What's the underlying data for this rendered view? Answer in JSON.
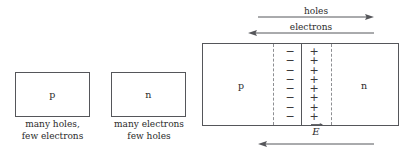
{
  "figure": {
    "colors": {
      "outline": "#55565a",
      "dashed": "#8d8e92",
      "text": "#2b2b2b",
      "background": "#ffffff"
    }
  },
  "p_block": {
    "letter": "p",
    "caption_line1": "many holes,",
    "caption_line2": "few electrons"
  },
  "n_block": {
    "letter": "n",
    "caption_line1": "many electrons",
    "caption_line2": "few holes"
  },
  "junction": {
    "p_letter": "p",
    "n_letter": "n",
    "negative_charges": [
      "−",
      "−",
      "−",
      "−",
      "−",
      "−",
      "−",
      "−"
    ],
    "positive_charges": [
      "+",
      "+",
      "+",
      "+",
      "+",
      "+",
      "+",
      "+"
    ],
    "negative_count": 8,
    "positive_count": 8
  },
  "arrows": {
    "holes": {
      "label": "holes",
      "direction": "right"
    },
    "electrons": {
      "label": "electrons",
      "direction": "left"
    },
    "efield": {
      "label": "E",
      "accent": "vector-arrow",
      "direction": "left"
    }
  }
}
